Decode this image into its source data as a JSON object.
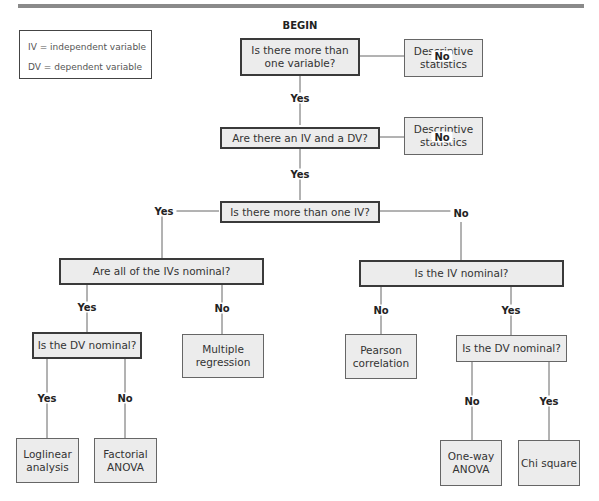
{
  "legend": {
    "iv": "IV = independent variable",
    "dv": "DV = dependent variable"
  },
  "begin_label": "BEGIN",
  "nodes": {
    "q1": "Is there more than one variable?",
    "q2": "Are there an IV and a DV?",
    "q3": "Is there more than one IV?",
    "q4": "Are all of the IVs nominal?",
    "q5": "Is the IV nominal?",
    "q6": "Is the DV nominal?",
    "q7": "Is the DV nominal?",
    "r1": "Descriptive statistics",
    "r2": "Descriptive statistics",
    "r3": "Multiple regression",
    "r4": "Pearson correlation",
    "r5": "Loglinear analysis",
    "r6": "Factorial ANOVA",
    "r7": "One-way ANOVA",
    "r8": "Chi square"
  },
  "edges": {
    "q1_yes": "Yes",
    "q1_no": "No",
    "q2_yes": "Yes",
    "q2_no": "No",
    "q3_yes": "Yes",
    "q3_no": "No",
    "q4_yes": "Yes",
    "q4_no": "No",
    "q5_no": "No",
    "q5_yes": "Yes",
    "q6_yes": "Yes",
    "q6_no": "No",
    "q7_no": "No",
    "q7_yes": "Yes"
  }
}
